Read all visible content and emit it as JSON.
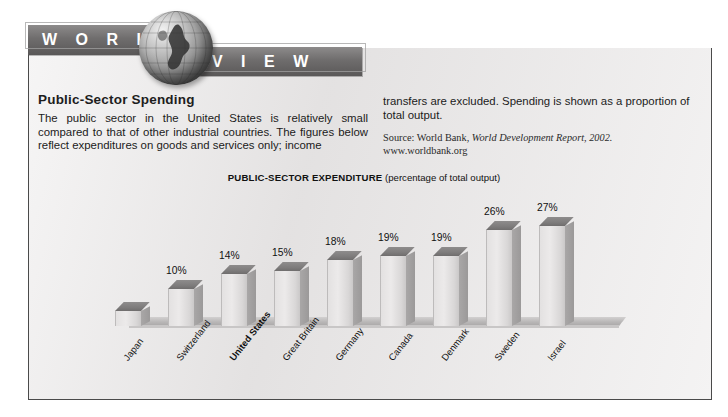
{
  "banner": {
    "word_1": "W O R L D",
    "word_2": "V I E W",
    "globe_icon": "globe-icon"
  },
  "article": {
    "headline": "Public-Sector Spending",
    "body_left": "The public sector in the United States is relatively small compared to that of other industrial countries. The figures below reflect expenditures on goods and services only; income",
    "body_right": "transfers are excluded. Spending is shown as a proportion of total output.",
    "source_prefix": "Source: World Bank, ",
    "source_italic": "World Development Report, 2002.",
    "source_url": "www.worldbank.org"
  },
  "chart_data": {
    "type": "bar",
    "title": "PUBLIC-SECTOR EXPENDITURE",
    "subtitle": "(percentage of total output)",
    "xlabel": "",
    "ylabel": "percentage of total output",
    "ylim": [
      0,
      32
    ],
    "grid": false,
    "legend": "none",
    "unit": "%",
    "categories": [
      "Japan",
      "Switzerland",
      "United States",
      "Great Britain",
      "Germany",
      "Canada",
      "Denmark",
      "Sweden",
      "Israel"
    ],
    "values": [
      4,
      10,
      14,
      15,
      18,
      19,
      19,
      26,
      27
    ],
    "labels": [
      "",
      "10%",
      "14%",
      "15%",
      "18%",
      "19%",
      "19%",
      "26%",
      "27%"
    ],
    "highlight_category": "United States",
    "bars": [
      {
        "category": "Japan",
        "value": 4,
        "label": "",
        "bold": false
      },
      {
        "category": "Switzerland",
        "value": 10,
        "label": "10%",
        "bold": false
      },
      {
        "category": "United States",
        "value": 14,
        "label": "14%",
        "bold": true
      },
      {
        "category": "Great Britain",
        "value": 15,
        "label": "15%",
        "bold": false
      },
      {
        "category": "Germany",
        "value": 18,
        "label": "18%",
        "bold": false
      },
      {
        "category": "Canada",
        "value": 19,
        "label": "19%",
        "bold": false
      },
      {
        "category": "Denmark",
        "value": 19,
        "label": "19%",
        "bold": false
      },
      {
        "category": "Sweden",
        "value": 26,
        "label": "26%",
        "bold": false
      },
      {
        "category": "Israel",
        "value": 27,
        "label": "27%",
        "bold": false
      }
    ]
  },
  "colors": {
    "panel_background": "#eceaea",
    "banner_band": "#6f6d6d",
    "banner_text": "#ffffff",
    "bar_face": "#e3e1e1",
    "bar_top": "#7e7c7c",
    "text": "#1b1b1b"
  }
}
